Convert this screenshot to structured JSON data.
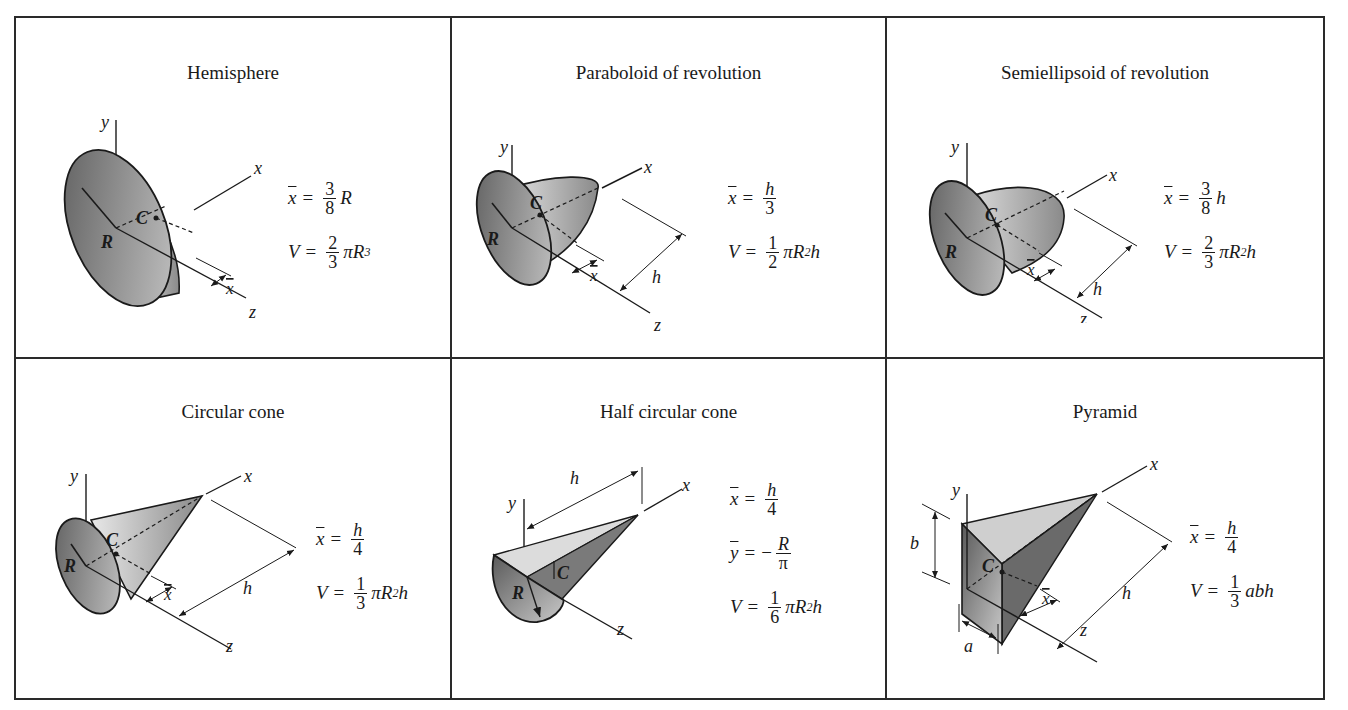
{
  "table": {
    "cells": [
      {
        "title": "Hemisphere",
        "formulas": [
          {
            "lhs": "x",
            "lhs_bar": true,
            "num": "3",
            "den": "8",
            "rhs": "R"
          },
          {
            "lhs": "V",
            "lhs_bar": false,
            "num": "2",
            "den": "3",
            "rhs": "πR",
            "rhs_sup": "3"
          }
        ],
        "labels": {
          "x": "x",
          "y": "y",
          "z": "z",
          "R": "R",
          "C": "C",
          "xbar": "x"
        }
      },
      {
        "title": "Paraboloid of revolution",
        "formulas": [
          {
            "lhs": "x",
            "lhs_bar": true,
            "num": "h",
            "den": "3",
            "rhs": ""
          },
          {
            "lhs": "V",
            "lhs_bar": false,
            "num": "1",
            "den": "2",
            "rhs": "πR",
            "rhs_sup": "2",
            "rhs_tail": "h"
          }
        ],
        "labels": {
          "x": "x",
          "y": "y",
          "z": "z",
          "R": "R",
          "C": "C",
          "xbar": "x",
          "h": "h"
        }
      },
      {
        "title": "Semiellipsoid of revolution",
        "formulas": [
          {
            "lhs": "x",
            "lhs_bar": true,
            "num": "3",
            "den": "8",
            "rhs": "h"
          },
          {
            "lhs": "V",
            "lhs_bar": false,
            "num": "2",
            "den": "3",
            "rhs": "πR",
            "rhs_sup": "2",
            "rhs_tail": "h"
          }
        ],
        "labels": {
          "x": "x",
          "y": "y",
          "z": "z",
          "R": "R",
          "C": "C",
          "xbar": "x",
          "h": "h"
        }
      },
      {
        "title": "Circular cone",
        "formulas": [
          {
            "lhs": "x",
            "lhs_bar": true,
            "num": "h",
            "den": "4",
            "rhs": ""
          },
          {
            "lhs": "V",
            "lhs_bar": false,
            "num": "1",
            "den": "3",
            "rhs": "πR",
            "rhs_sup": "2",
            "rhs_tail": "h"
          }
        ],
        "labels": {
          "x": "x",
          "y": "y",
          "z": "z",
          "R": "R",
          "C": "C",
          "xbar": "x",
          "h": "h"
        }
      },
      {
        "title": "Half circular cone",
        "formulas": [
          {
            "lhs": "x",
            "lhs_bar": true,
            "num": "h",
            "den": "4",
            "rhs": ""
          },
          {
            "lhs": "y",
            "lhs_bar": true,
            "prefix": "−",
            "num": "R",
            "den": "π",
            "rhs": ""
          },
          {
            "lhs": "V",
            "lhs_bar": false,
            "num": "1",
            "den": "6",
            "rhs": "πR",
            "rhs_sup": "2",
            "rhs_tail": "h"
          }
        ],
        "labels": {
          "x": "x",
          "y": "y",
          "z": "z",
          "R": "R",
          "C": "C",
          "h": "h"
        }
      },
      {
        "title": "Pyramid",
        "formulas": [
          {
            "lhs": "x",
            "lhs_bar": true,
            "num": "h",
            "den": "4",
            "rhs": ""
          },
          {
            "lhs": "V",
            "lhs_bar": false,
            "num": "1",
            "den": "3",
            "rhs": "abh"
          }
        ],
        "labels": {
          "x": "x",
          "y": "y",
          "z": "z",
          "C": "C",
          "xbar": "x",
          "h": "h",
          "a": "a",
          "b": "b"
        }
      }
    ]
  },
  "colors": {
    "line": "#2a2a2a",
    "shade_dark": "#6e6e6e",
    "shade_light": "#d8d8d8"
  }
}
